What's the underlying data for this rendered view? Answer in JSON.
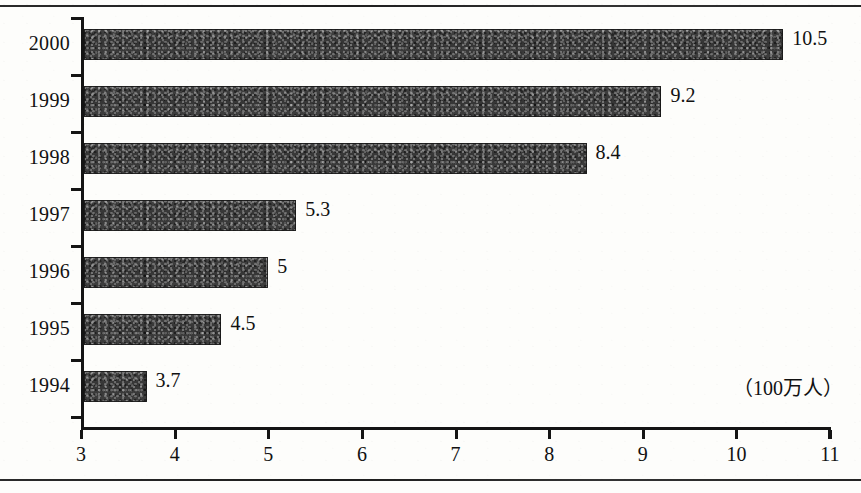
{
  "chart_data": {
    "type": "bar",
    "orientation": "horizontal",
    "title": "",
    "xlabel": "",
    "ylabel": "",
    "unit_label": "（100万人）",
    "categories": [
      "2000",
      "1999",
      "1998",
      "1997",
      "1996",
      "1995",
      "1994"
    ],
    "values": [
      10.5,
      9.2,
      8.4,
      5.3,
      5,
      4.5,
      3.7
    ],
    "value_labels": [
      "10.5",
      "9.2",
      "8.4",
      "5.3",
      "5",
      "4.5",
      "3.7"
    ],
    "xlim": [
      3,
      11
    ],
    "xticks": [
      3,
      4,
      5,
      6,
      7,
      8,
      9,
      10,
      11
    ],
    "xtick_labels": [
      "3",
      "4",
      "5",
      "6",
      "7",
      "8",
      "9",
      "10",
      "11"
    ],
    "grid": false,
    "legend": false,
    "bar_color": "#3b3b3b",
    "axis_color": "#141414",
    "background_color": "#fdfdfb"
  }
}
